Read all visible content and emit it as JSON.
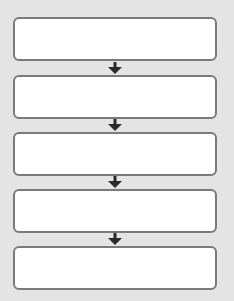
{
  "diagram": {
    "type": "flowchart",
    "direction": "top-to-bottom",
    "colors": {
      "background": "#e4e4e4",
      "box_fill": "#ffffff",
      "box_border": "#7a7a7a",
      "arrow": "#2a2a2a"
    },
    "boxes": [
      {
        "label": ""
      },
      {
        "label": ""
      },
      {
        "label": ""
      },
      {
        "label": ""
      },
      {
        "label": ""
      }
    ],
    "arrows": [
      {
        "from": 0,
        "to": 1,
        "icon": "arrow-down-icon"
      },
      {
        "from": 1,
        "to": 2,
        "icon": "arrow-down-icon"
      },
      {
        "from": 2,
        "to": 3,
        "icon": "arrow-down-icon"
      },
      {
        "from": 3,
        "to": 4,
        "icon": "arrow-down-icon"
      }
    ]
  }
}
